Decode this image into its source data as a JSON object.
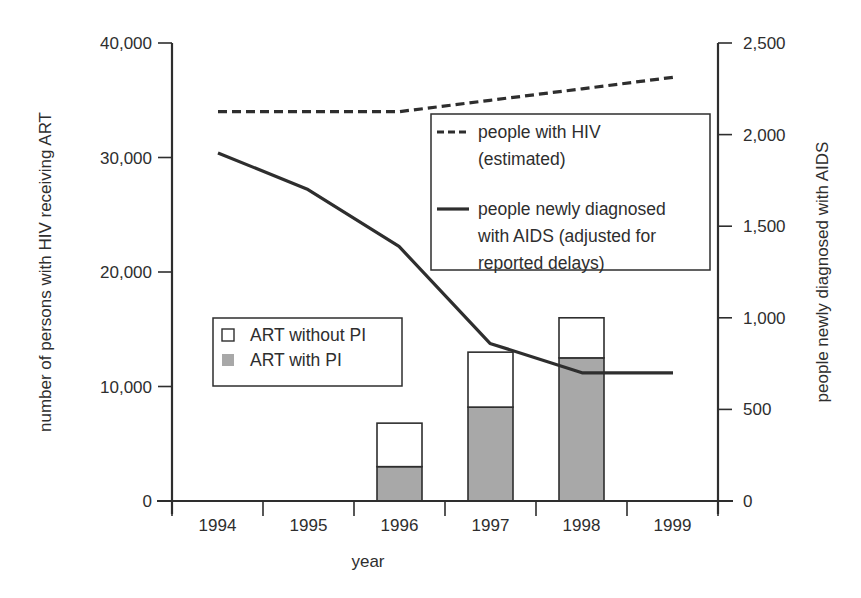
{
  "chart_data": {
    "type": "bar+line",
    "title": "",
    "xlabel": "year",
    "ylabel_left": "number of persons with HIV receiving ART",
    "ylabel_right": "people newly diagnosed with AIDS",
    "categories": [
      "1994",
      "1995",
      "1996",
      "1997",
      "1998",
      "1999"
    ],
    "ylim_left": [
      0,
      40000
    ],
    "ylim_right": [
      0,
      2500
    ],
    "yticks_left": [
      "0",
      "10,000",
      "20,000",
      "30,000",
      "40,000"
    ],
    "yticks_right": [
      "0",
      "500",
      "1,000",
      "1,500",
      "2,000",
      "2,500"
    ],
    "grid": false,
    "bar_series": [
      {
        "name": "ART with PI",
        "axis": "left",
        "color": "#a8a8a8",
        "values": [
          0,
          0,
          3000,
          8200,
          12500,
          0
        ]
      },
      {
        "name": "ART without PI",
        "axis": "left",
        "color": "#ffffff",
        "values": [
          0,
          0,
          3800,
          4800,
          3500,
          0
        ]
      }
    ],
    "bar_totals": [
      0,
      0,
      6800,
      13000,
      16000,
      0
    ],
    "line_series": [
      {
        "name": "people with HIV (estimated)",
        "axis": "left",
        "style": "dashed",
        "color": "#2e2e2e",
        "values": [
          34000,
          34000,
          34000,
          35000,
          36000,
          37000
        ]
      },
      {
        "name": "people newly diagnosed with AIDS (adjusted for reported delays)",
        "axis": "right",
        "style": "solid",
        "color": "#2e2e2e",
        "values": [
          1900,
          1700,
          1390,
          860,
          700,
          700
        ]
      }
    ],
    "legend_lines": {
      "position": "upper right",
      "entries": [
        {
          "style": "dashed",
          "lines": [
            "people with HIV",
            "(estimated)"
          ]
        },
        {
          "style": "solid",
          "lines": [
            "people newly diagnosed",
            "with AIDS (adjusted for",
            "reported delays)"
          ]
        }
      ]
    },
    "legend_bars": {
      "position": "middle left",
      "entries": [
        {
          "fill": "#ffffff",
          "label": "ART without PI"
        },
        {
          "fill": "#a8a8a8",
          "label": "ART with PI"
        }
      ]
    }
  }
}
